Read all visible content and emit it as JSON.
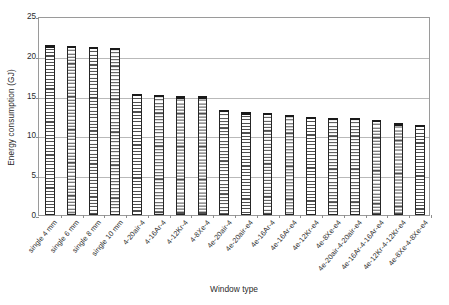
{
  "chart_data": {
    "type": "bar",
    "title": "",
    "xlabel": "Window type",
    "ylabel": "Energy consumption (GJ)",
    "ylim": [
      0,
      25
    ],
    "yticks": [
      0,
      5,
      10,
      15,
      20,
      25
    ],
    "ytick_labels": [
      "0",
      "5",
      "10",
      "15",
      "20",
      "25"
    ],
    "grid": "horizontal",
    "legend": "none",
    "bar_fill": "horizontal-hatch",
    "categories": [
      "single 4 mm",
      "single 6 mm",
      "single 8 mm",
      "single 10 mm",
      "4-20air-4",
      "4-16Ar-4",
      "4-12Kr-4",
      "4-8Xe-4",
      "4e-20air-4",
      "4e-20air-e4",
      "4e-16Ar-4",
      "4e-16Ar-e4",
      "4e-12Kr-e4",
      "4e-8Xe-e4",
      "4e-20air-4-20air-e4",
      "4e-16Ar-4-16Ar-e4",
      "4e-12Kr-4-12Kr-e4",
      "4e-8Xe-4-8Xe-e4"
    ],
    "values": [
      21.3,
      21.2,
      21.1,
      21.0,
      15.2,
      15.1,
      14.9,
      14.9,
      13.2,
      12.9,
      12.8,
      12.6,
      12.3,
      12.2,
      12.2,
      11.9,
      11.5,
      11.3
    ]
  },
  "colors": {
    "axis": "#9a9a9a",
    "grid": "#b9b9b9",
    "bar_edge": "#262626",
    "bar_hatch": "#4f4f4f",
    "text": "#2b2b2b",
    "background": "#ffffff"
  }
}
